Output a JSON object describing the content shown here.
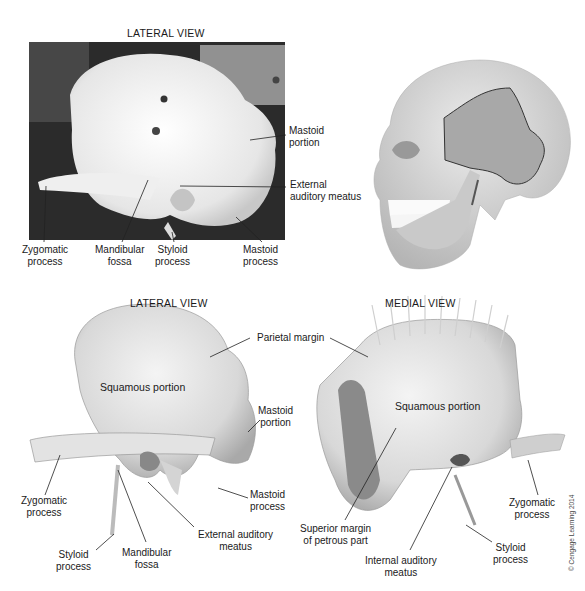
{
  "panels": {
    "photo": {
      "title": "LATERAL VIEW",
      "labels": {
        "mastoid_portion": "Mastoid\nportion",
        "external_auditory_meatus": "External\nauditory meatus",
        "zygomatic_process": "Zygomatic\nprocess",
        "mandibular_fossa": "Mandibular\nfossa",
        "styloid_process": "Styloid\nprocess",
        "mastoid_process": "Mastoid\nprocess"
      }
    },
    "lateral": {
      "title": "LATERAL VIEW",
      "labels": {
        "squamous_portion": "Squamous portion",
        "parietal_margin": "Parietal margin",
        "mastoid_portion": "Mastoid\nportion",
        "zygomatic_process": "Zygomatic\nprocess",
        "mastoid_process": "Mastoid\nprocess",
        "external_auditory_meatus": "External auditory\nmeatus",
        "styloid_process": "Styloid\nprocess",
        "mandibular_fossa": "Mandibular\nfossa"
      }
    },
    "medial": {
      "title": "MEDIAL VIEW",
      "labels": {
        "squamous_portion": "Squamous portion",
        "superior_margin": "Superior margin\nof petrous part",
        "internal_auditory_meatus": "Internal auditory\nmeatus",
        "styloid_process": "Styloid\nprocess",
        "zygomatic_process": "Zygomatic\nprocess"
      }
    }
  },
  "copyright": "© Cengage Learning 2014"
}
